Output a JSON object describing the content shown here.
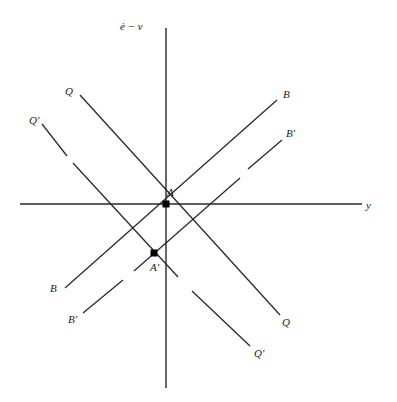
{
  "diagram": {
    "axes": {
      "vertical_label": "ė − v",
      "horizontal_label": "y"
    },
    "curves": {
      "Q": {
        "label_top": "Q",
        "label_bottom": "Q",
        "style": "solid"
      },
      "Q_prime": {
        "label_top": "Q′",
        "label_bottom": "Q′",
        "style": "broken"
      },
      "B": {
        "label_top": "B",
        "label_bottom": "B",
        "style": "solid"
      },
      "B_prime": {
        "label_top": "B′",
        "label_bottom": "B′",
        "style": "broken"
      }
    },
    "points": {
      "A": {
        "label": "A"
      },
      "A_prime": {
        "label": "A′"
      }
    }
  }
}
